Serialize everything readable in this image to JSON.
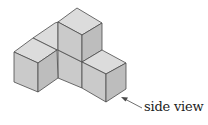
{
  "figure": {
    "cube_count": 5,
    "annotation": "side view",
    "colors": {
      "top_face": "#dcdcdc",
      "left_face": "#cacaca",
      "right_face": "#bdbdbd",
      "edge": "#4a4a4a"
    }
  }
}
